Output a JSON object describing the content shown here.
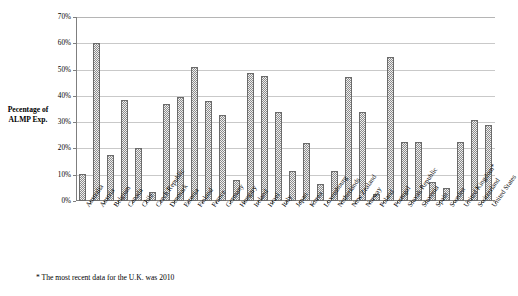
{
  "chart_data": {
    "type": "bar",
    "title": "",
    "subtitle": "",
    "xlabel": "",
    "ylabel": "Pecentage of ALMP Exp.",
    "ylim": [
      0,
      70
    ],
    "ytick_labels": [
      "0%",
      "10%",
      "20%",
      "30%",
      "40%",
      "50%",
      "60%",
      "70%"
    ],
    "ytick_values": [
      0,
      10,
      20,
      30,
      40,
      50,
      60,
      70
    ],
    "grid": true,
    "legend": null,
    "legend_position": "none",
    "categories": [
      "Australia",
      "Austria",
      "Belgium",
      "Canada",
      "Chile",
      "Czech Republic",
      "Denmark",
      "Estonia",
      "Finland",
      "France",
      "Germany",
      "Hungary",
      "Ireland",
      "Israel",
      "Italy",
      "Japan",
      "Korea",
      "Luxembourg",
      "Netherlands",
      "New Zealand",
      "Norway",
      "Poland",
      "Portugal",
      "Slovak Republic",
      "Slovenia",
      "Spain",
      "Sweden",
      "United Kingdom*",
      "Switzerland",
      "United States"
    ],
    "values": [
      10.2,
      60.0,
      17.6,
      38.6,
      20.0,
      3.4,
      37.0,
      39.4,
      51.0,
      38.0,
      32.8,
      8.0,
      48.8,
      47.4,
      34.0,
      11.4,
      22.0,
      6.6,
      11.6,
      47.0,
      34.0,
      2.8,
      54.6,
      22.4,
      22.6,
      7.4,
      4.8,
      22.6,
      31.0,
      29.0
    ],
    "series_color": "#8c8c8c",
    "annotations": [
      "* The most recent data for the U.K. was 2010"
    ]
  },
  "footnote": "* The most recent data for the U.K. was 2010",
  "axis": {
    "y_title_line1": "Pecentage of",
    "y_title_line2": "ALMP Exp."
  }
}
